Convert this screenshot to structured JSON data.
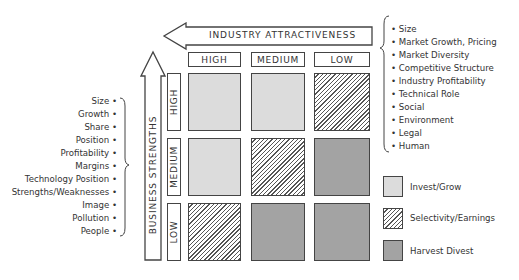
{
  "axes": {
    "horizontal": "INDUSTRY ATTRACTIVENESS",
    "vertical": "BUSINESS STRENGTHS"
  },
  "columns": [
    "HIGH",
    "MEDIUM",
    "LOW"
  ],
  "rows": [
    "HIGH",
    "MEDIUM",
    "LOW"
  ],
  "grid": [
    [
      "Invest/Grow",
      "Invest/Grow",
      "Selectivity/Earnings"
    ],
    [
      "Invest/Grow",
      "Selectivity/Earnings",
      "Harvest Divest"
    ],
    [
      "Selectivity/Earnings",
      "Harvest Divest",
      "Harvest Divest"
    ]
  ],
  "industry_factors": [
    "Size",
    "Market Growth, Pricing",
    "Market Diversity",
    "Competitive Structure",
    "Industry Profitability",
    "Technical Role",
    "Social",
    "Environment",
    "Legal",
    "Human"
  ],
  "business_factors": [
    "Size",
    "Growth",
    "Share",
    "Position",
    "Profitability",
    "Margins",
    "Technology Position",
    "Strengths/Weaknesses",
    "Image",
    "Pollution",
    "People"
  ],
  "legend": [
    {
      "label": "Invest/Grow",
      "style": "light",
      "color": "#dcdcdc"
    },
    {
      "label": "Selectivity/Earnings",
      "style": "hatch",
      "color": "#555555"
    },
    {
      "label": "Harvest Divest",
      "style": "dark",
      "color": "#a3a3a3"
    }
  ]
}
